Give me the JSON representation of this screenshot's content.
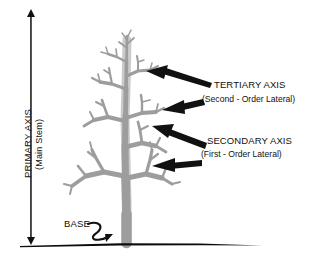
{
  "figure": {
    "kind": "botanical-branching-diagram",
    "background_color": "#ffffff",
    "tree_color": "#9d9d9d",
    "tree_shadow_color": "#b9b9b9",
    "ink_color": "#111111",
    "ground_color": "#000000"
  },
  "axis": {
    "primary_label": "PRIMARY AXIS",
    "primary_sublabel": "(Main Stem)"
  },
  "callouts": [
    {
      "id": "tertiary",
      "title": "TERTIARY AXIS",
      "subtitle": "(Second - Order Lateral)"
    },
    {
      "id": "secondary",
      "title": "SECONDARY AXIS",
      "subtitle": "(First - Order Lateral)"
    }
  ],
  "base": {
    "label": "BASE"
  }
}
